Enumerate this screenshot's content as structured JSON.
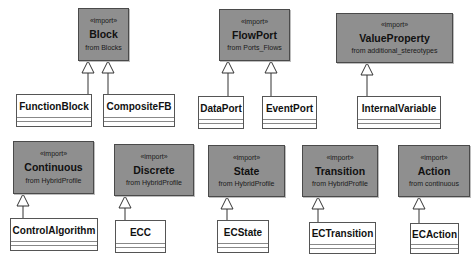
{
  "diagram": {
    "type": "uml-class-diagram",
    "colors": {
      "imported_fill": "#8f8f8f",
      "class_fill": "#ffffff",
      "line": "#4a4a4a"
    },
    "imported_classes": [
      {
        "id": "block",
        "stereotype": "«import»",
        "name": "Block",
        "from": "from Blocks"
      },
      {
        "id": "flowport",
        "stereotype": "«import»",
        "name": "FlowPort",
        "from": "from Ports_Flows"
      },
      {
        "id": "valueproperty",
        "stereotype": "«import»",
        "name": "ValueProperty",
        "from": "from additional_stereotypes"
      },
      {
        "id": "continuous",
        "stereotype": "«import»",
        "name": "Continuous",
        "from": "from HybridProfile"
      },
      {
        "id": "discrete",
        "stereotype": "«import»",
        "name": "Discrete",
        "from": "from HybridProfile"
      },
      {
        "id": "state",
        "stereotype": "«import»",
        "name": "State",
        "from": "from HybridProfile"
      },
      {
        "id": "transition",
        "stereotype": "«import»",
        "name": "Transition",
        "from": "from HybridProfile"
      },
      {
        "id": "action",
        "stereotype": "«import»",
        "name": "Action",
        "from": "from continuous"
      }
    ],
    "classes": [
      {
        "id": "functionblock",
        "name": "FunctionBlock",
        "generalizes": "Block"
      },
      {
        "id": "compositefb",
        "name": "CompositeFB",
        "generalizes": "Block"
      },
      {
        "id": "dataport",
        "name": "DataPort",
        "generalizes": "FlowPort"
      },
      {
        "id": "eventport",
        "name": "EventPort",
        "generalizes": "FlowPort"
      },
      {
        "id": "internalvariable",
        "name": "InternalVariable",
        "generalizes": "ValueProperty"
      },
      {
        "id": "controlalgorithm",
        "name": "ControlAlgorithm",
        "generalizes": "Continuous"
      },
      {
        "id": "ecc",
        "name": "ECC",
        "generalizes": "Discrete"
      },
      {
        "id": "ecstate",
        "name": "ECState",
        "generalizes": "State"
      },
      {
        "id": "ectransition",
        "name": "ECTransition",
        "generalizes": "Transition"
      },
      {
        "id": "ecaction",
        "name": "ECAction",
        "generalizes": "Action"
      }
    ]
  }
}
